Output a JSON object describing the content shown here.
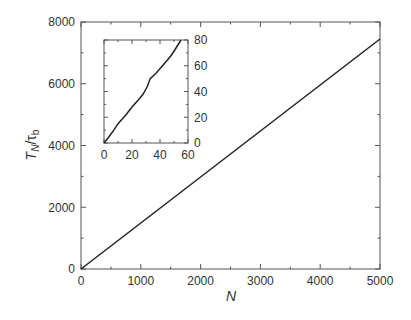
{
  "chart_data": [
    {
      "type": "line",
      "title": "",
      "xlabel": "N",
      "ylabel": "T_N/τ_b",
      "xlim": [
        0,
        5000
      ],
      "ylim": [
        0,
        8000
      ],
      "xticks": [
        0,
        1000,
        2000,
        3000,
        4000,
        5000
      ],
      "yticks": [
        0,
        2000,
        4000,
        6000,
        8000
      ],
      "grid": false,
      "series": [
        {
          "name": "T_N/tau_b",
          "x": [
            0,
            1000,
            2000,
            3000,
            4000,
            5000
          ],
          "y": [
            0,
            1490,
            2980,
            4470,
            5960,
            7450
          ]
        }
      ]
    },
    {
      "type": "line",
      "title": "inset",
      "xlabel": "",
      "ylabel": "",
      "xlim": [
        0,
        60
      ],
      "ylim": [
        0,
        80
      ],
      "xticks": [
        0,
        20,
        40,
        60
      ],
      "yticks": [
        0,
        20,
        40,
        60,
        80
      ],
      "y_axis_side": "right",
      "grid": false,
      "series": [
        {
          "name": "T_N/tau_b (small N)",
          "x": [
            0,
            3,
            7,
            10,
            15,
            20,
            25,
            28,
            31,
            33,
            37,
            41,
            45,
            48,
            51,
            55
          ],
          "y": [
            0,
            4,
            10,
            15,
            21,
            28,
            34,
            38,
            44,
            50,
            54,
            59,
            64,
            68,
            73,
            80
          ]
        }
      ]
    }
  ],
  "labels": {
    "ylabel_main": "T",
    "ylabel_sub": "N",
    "ylabel_slash": "/τ",
    "ylabel_sub2": "b",
    "xlabel": "N"
  },
  "colors": {
    "axis": "#555555",
    "line": "#222222",
    "text": "#333333"
  }
}
